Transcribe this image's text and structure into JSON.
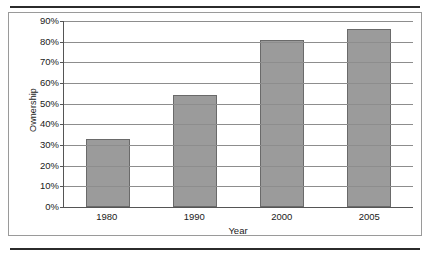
{
  "chart_data": {
    "type": "bar",
    "title": "",
    "xlabel": "Year",
    "ylabel": "Ownership",
    "categories": [
      "1980",
      "1990",
      "2000",
      "2005"
    ],
    "values": [
      33,
      54,
      81,
      86
    ],
    "ylim": [
      0,
      90
    ],
    "ytick_labels": [
      "0%",
      "10%",
      "20%",
      "30%",
      "40%",
      "50%",
      "60%",
      "70%",
      "80%",
      "90%"
    ],
    "ytick_values": [
      0,
      10,
      20,
      30,
      40,
      50,
      60,
      70,
      80,
      90
    ],
    "grid": true,
    "legend": false,
    "bar_color": "#9b9b9b",
    "bar_border_color": "#6a6a6a",
    "axis_color": "#555555",
    "gridline_color": "#8d8d8d",
    "frame_color": "#9a9a9a",
    "rule_color": "#2b2b2b"
  }
}
